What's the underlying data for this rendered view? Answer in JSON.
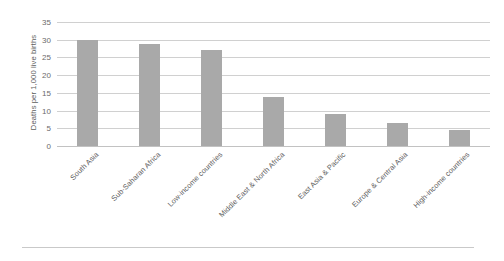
{
  "chart_data": {
    "type": "bar",
    "title": "",
    "subtitle": "",
    "xlabel": "",
    "ylabel": "Deaths per 1,000 live births",
    "ylim": [
      0,
      35
    ],
    "yticks": [
      0,
      5,
      10,
      15,
      20,
      25,
      30,
      35
    ],
    "ytick_labels": [
      "0",
      "5",
      "10",
      "15",
      "20",
      "25",
      "30",
      "35"
    ],
    "grid": "horizontal",
    "legend": "none",
    "bar_color": "#a9a9a9",
    "gridline_color": "#d0d0d0",
    "categories": [
      "South Asia",
      "Sub-Saharan Africa",
      "Low-income countries",
      "Middle East & North Africa",
      "East Asia & Pacific",
      "Europe & Central Asia",
      "High-income countries"
    ],
    "values": [
      30.0,
      28.7,
      27.0,
      13.7,
      8.9,
      6.4,
      4.4
    ],
    "series": [
      {
        "name": "Neonatal mortality rate",
        "values": [
          30.0,
          28.7,
          27.0,
          13.7,
          8.9,
          6.4,
          4.4
        ]
      }
    ]
  }
}
